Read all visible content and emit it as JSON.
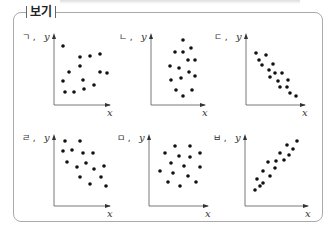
{
  "header": {
    "label": "보기"
  },
  "plots": [
    {
      "id": "ㄱ",
      "caption": "ㄱ",
      "correlation": "weak positive"
    },
    {
      "id": "ㄴ",
      "caption": "ㄴ",
      "correlation": "none"
    },
    {
      "id": "ㄷ",
      "caption": "ㄷ",
      "correlation": "strong negative"
    },
    {
      "id": "ㄹ",
      "caption": "ㄹ",
      "correlation": "weak negative"
    },
    {
      "id": "ㅁ",
      "caption": "ㅁ",
      "correlation": "none"
    },
    {
      "id": "ㅂ",
      "caption": "ㅂ",
      "correlation": "strong positive"
    }
  ],
  "axes": {
    "x": "x",
    "y": "y"
  },
  "chart_data": [
    {
      "type": "scatter",
      "title": "ㄱ",
      "xlabel": "x",
      "ylabel": "y",
      "points": [
        [
          63,
          46
        ],
        [
          80,
          57
        ],
        [
          90,
          56
        ],
        [
          100,
          54
        ],
        [
          80,
          66
        ],
        [
          100,
          72
        ],
        [
          69,
          72
        ],
        [
          83,
          80
        ],
        [
          107,
          73
        ],
        [
          63,
          81
        ],
        [
          94,
          85
        ],
        [
          65,
          92
        ],
        [
          74,
          92
        ],
        [
          84,
          89
        ]
      ]
    },
    {
      "type": "scatter",
      "title": "ㄴ",
      "xlabel": "x",
      "ylabel": "y",
      "points": [
        [
          183,
          40
        ],
        [
          175,
          52
        ],
        [
          183,
          52
        ],
        [
          191,
          48
        ],
        [
          188,
          60
        ],
        [
          195,
          60
        ],
        [
          170,
          66
        ],
        [
          179,
          68
        ],
        [
          189,
          72
        ],
        [
          171,
          80
        ],
        [
          181,
          78
        ],
        [
          195,
          76
        ],
        [
          176,
          90
        ],
        [
          192,
          90
        ],
        [
          183,
          96
        ]
      ]
    },
    {
      "type": "scatter",
      "title": "ㄷ",
      "xlabel": "x",
      "ylabel": "y",
      "points": [
        [
          256,
          53
        ],
        [
          266,
          55
        ],
        [
          259,
          60
        ],
        [
          262,
          65
        ],
        [
          273,
          64
        ],
        [
          269,
          70
        ],
        [
          275,
          73
        ],
        [
          282,
          73
        ],
        [
          270,
          77
        ],
        [
          278,
          81
        ],
        [
          288,
          80
        ],
        [
          280,
          87
        ],
        [
          287,
          87
        ],
        [
          290,
          93
        ],
        [
          296,
          96
        ]
      ]
    },
    {
      "type": "scatter",
      "title": "ㄹ",
      "xlabel": "x",
      "ylabel": "y",
      "points": [
        [
          65,
          141
        ],
        [
          80,
          141
        ],
        [
          63,
          151
        ],
        [
          72,
          150
        ],
        [
          83,
          153
        ],
        [
          93,
          153
        ],
        [
          67,
          162
        ],
        [
          86,
          163
        ],
        [
          77,
          167
        ],
        [
          94,
          169
        ],
        [
          104,
          166
        ],
        [
          80,
          177
        ],
        [
          101,
          177
        ],
        [
          90,
          184
        ],
        [
          106,
          186
        ]
      ]
    },
    {
      "type": "scatter",
      "title": "ㅁ",
      "xlabel": "x",
      "ylabel": "y",
      "points": [
        [
          175,
          146
        ],
        [
          190,
          146
        ],
        [
          165,
          153
        ],
        [
          179,
          156
        ],
        [
          190,
          157
        ],
        [
          200,
          153
        ],
        [
          171,
          163
        ],
        [
          184,
          166
        ],
        [
          200,
          167
        ],
        [
          160,
          171
        ],
        [
          173,
          173
        ],
        [
          188,
          176
        ],
        [
          168,
          182
        ],
        [
          196,
          182
        ],
        [
          180,
          186
        ]
      ]
    },
    {
      "type": "scatter",
      "title": "ㅂ",
      "xlabel": "x",
      "ylabel": "y",
      "points": [
        [
          297,
          141
        ],
        [
          287,
          145
        ],
        [
          293,
          149
        ],
        [
          280,
          153
        ],
        [
          289,
          155
        ],
        [
          268,
          162
        ],
        [
          276,
          161
        ],
        [
          284,
          160
        ],
        [
          275,
          168
        ],
        [
          263,
          171
        ],
        [
          270,
          176
        ],
        [
          257,
          179
        ],
        [
          263,
          183
        ],
        [
          260,
          186
        ],
        [
          255,
          190
        ]
      ]
    }
  ]
}
